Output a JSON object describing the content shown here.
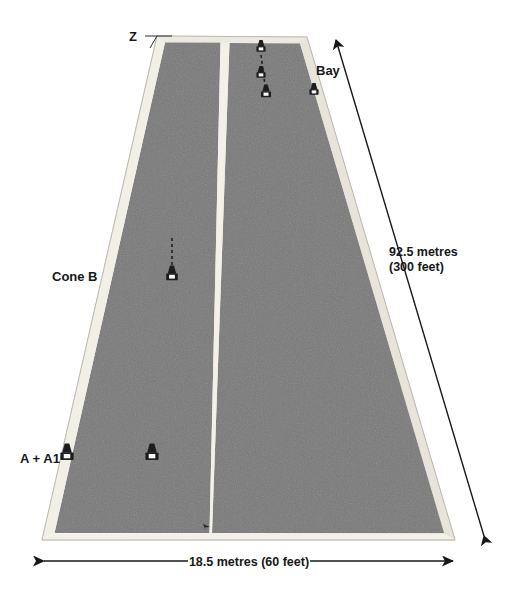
{
  "figure": {
    "surface_color": "#797979",
    "surface_edge_color": "#efece4",
    "centre_line_color": "#f2efe6",
    "background_color": "#ffffff",
    "marker_color": "#1b1d1f",
    "line_color": "#16181a"
  },
  "labels": {
    "z": "Z",
    "bay": "Bay",
    "cone_b": "Cone B",
    "a_a1": "A + A1"
  },
  "dimensions": {
    "length": {
      "metric": "92.5 metres",
      "imperial": "(300 feet)"
    },
    "width": {
      "text": "18.5 metres (60 feet)"
    }
  },
  "markers": {
    "cones": [
      {
        "name": "cone-top-lane2-1",
        "x": 261,
        "y": 46
      },
      {
        "name": "cone-top-lane2-2",
        "x": 261,
        "y": 72
      },
      {
        "name": "cone-top-lane2-3",
        "x": 266,
        "y": 91
      },
      {
        "name": "cone-bay-edge",
        "x": 314,
        "y": 89
      },
      {
        "name": "cone-mid-lane1",
        "x": 172,
        "y": 273
      },
      {
        "name": "cone-a",
        "x": 67,
        "y": 452
      },
      {
        "name": "cone-a1",
        "x": 152,
        "y": 452
      }
    ],
    "dashed_guides": [
      {
        "name": "guide-top-lane2",
        "x1": 261,
        "y1": 58,
        "x2": 264,
        "y2": 86
      },
      {
        "name": "guide-mid-lane1",
        "x1": 172,
        "y1": 240,
        "x2": 172,
        "y2": 268
      }
    ],
    "ground_mark": {
      "name": "ground-arrow-mark",
      "x": 203,
      "y": 524
    }
  },
  "geometry": {
    "surface_outer": "157,36 307,37 455,540 42,540",
    "lane_left": "165,42 220,42 196,533 54,533",
    "lane_right": "230,42 300,44 447,533 211,533",
    "centre_line": "221,42 229,42 210,533 197,533"
  },
  "annotations": {
    "length_arrow": {
      "x1": 486,
      "y1": 540,
      "x2": 333,
      "y2": 35
    },
    "width_arrow": {
      "x1": 42,
      "y1": 561,
      "x2": 455,
      "y2": 561
    },
    "z_leader": {
      "x1": 146,
      "y1": 36,
      "x2": 170,
      "y2": 36
    }
  }
}
